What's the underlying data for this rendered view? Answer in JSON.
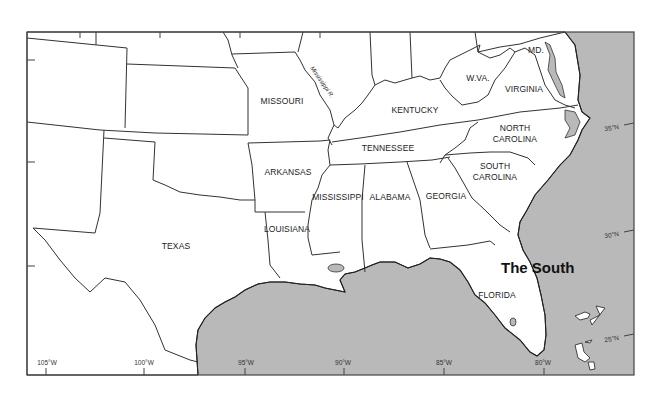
{
  "map": {
    "title": "The South",
    "colors": {
      "ocean": "#b9b9b9",
      "land": "#ffffff",
      "border": "#333333"
    },
    "states": [
      {
        "id": "missouri",
        "label": "MISSOURI"
      },
      {
        "id": "kentucky",
        "label": "KENTUCKY"
      },
      {
        "id": "west-virginia",
        "label": "W.VA."
      },
      {
        "id": "virginia",
        "label": "VIRGINIA"
      },
      {
        "id": "maryland",
        "label": "MD."
      },
      {
        "id": "north-carolina",
        "label_line1": "NORTH",
        "label_line2": "CAROLINA"
      },
      {
        "id": "tennessee",
        "label": "TENNESSEE"
      },
      {
        "id": "arkansas",
        "label": "ARKANSAS"
      },
      {
        "id": "south-carolina",
        "label_line1": "SOUTH",
        "label_line2": "CAROLINA"
      },
      {
        "id": "mississippi",
        "label": "MISSISSIPPI"
      },
      {
        "id": "alabama",
        "label": "ALABAMA"
      },
      {
        "id": "georgia",
        "label": "GEORGIA"
      },
      {
        "id": "louisiana",
        "label": "LOUISIANA"
      },
      {
        "id": "texas",
        "label": "TEXAS"
      },
      {
        "id": "florida",
        "label": "FLORIDA"
      }
    ],
    "river": {
      "label": "Mississippi R."
    },
    "longitudes": [
      "105°W",
      "100°W",
      "95°W",
      "90°W",
      "85°W",
      "80°W"
    ],
    "latitudes": [
      "35°N",
      "30°N",
      "25°N"
    ]
  }
}
